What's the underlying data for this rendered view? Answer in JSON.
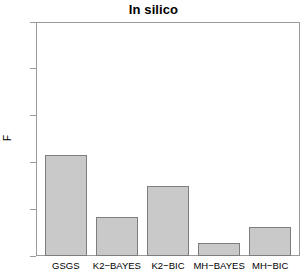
{
  "chart_data": {
    "type": "bar",
    "title": "In silico",
    "xlabel": "",
    "ylabel": "F",
    "categories": [
      "GSGS",
      "K2−BAYES",
      "K2−BIC",
      "MH−BAYES",
      "MH−BIC"
    ],
    "values": [
      0.43,
      0.167,
      0.3,
      0.055,
      0.124
    ],
    "ylim": [
      0.0,
      1.0
    ],
    "ytick_labels": [
      "0.0",
      "0.2",
      "0.4",
      "0.6",
      "0.8",
      "1.0"
    ],
    "ytick_values": [
      0.0,
      0.2,
      0.4,
      0.6,
      0.8,
      1.0
    ],
    "grid": false,
    "legend": null,
    "bar_fill_color": "#c9c9c9",
    "bar_border_color": "#7d7d7d",
    "axis_color": "#9a9a9a",
    "background_color": "#ffffff"
  }
}
